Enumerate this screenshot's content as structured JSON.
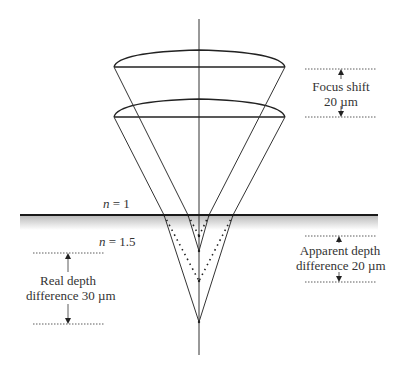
{
  "diagram": {
    "type": "optical-refraction",
    "media": {
      "upper": {
        "label": "n = 1",
        "n_symbol": "n",
        "value": "1"
      },
      "lower": {
        "label": "n = 1.5",
        "n_symbol": "n",
        "value": "1.5"
      }
    },
    "annotations": {
      "focus_shift": {
        "line1": "Focus shift",
        "line2": "20 µm"
      },
      "apparent_depth": {
        "line1": "Apparent depth",
        "line2": "difference 20 µm"
      },
      "real_depth": {
        "line1": "Real depth",
        "line2": "difference 30 µm"
      }
    },
    "colors": {
      "line": "#333333",
      "surface": "#1a1a1a",
      "shade": "#cccccc",
      "text": "#333333"
    }
  }
}
